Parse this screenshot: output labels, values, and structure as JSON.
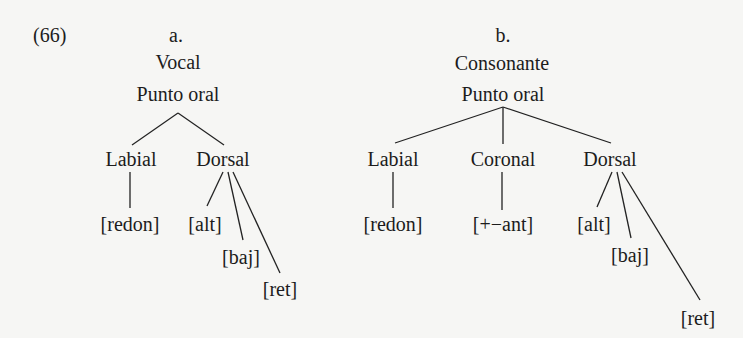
{
  "example_number": "(66)",
  "trees": [
    {
      "label": "a.",
      "root": "Vocal",
      "node": "Punto oral",
      "articulators": [
        {
          "name": "Labial",
          "features": [
            "[redon]"
          ]
        },
        {
          "name": "Dorsal",
          "features": [
            "[alt]",
            "[baj]",
            "[ret]"
          ]
        }
      ]
    },
    {
      "label": "b.",
      "root": "Consonante",
      "node": "Punto oral",
      "articulators": [
        {
          "name": "Labial",
          "features": [
            "[redon]"
          ]
        },
        {
          "name": "Coronal",
          "features": [
            "[+−ant]"
          ]
        },
        {
          "name": "Dorsal",
          "features": [
            "[alt]",
            "[baj]",
            "[ret]"
          ]
        }
      ]
    }
  ],
  "colors": {
    "background": "#f6f6f4",
    "ink": "#1c1c1c"
  }
}
